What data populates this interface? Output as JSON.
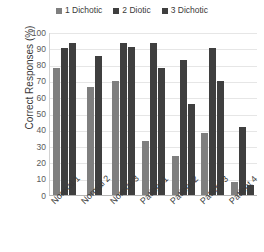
{
  "chart_data": {
    "type": "bar",
    "title": "",
    "subtitle": "",
    "xlabel": "",
    "ylabel": "Correct Responses (%)",
    "ylim": [
      0,
      100
    ],
    "ytick_step": 10,
    "yticks": [
      "100",
      "90",
      "80",
      "70",
      "60",
      "50",
      "40",
      "30",
      "20",
      "10",
      "0"
    ],
    "grid": true,
    "grid_axis": "y",
    "legend_position": "top-center",
    "categories": [
      "Normal 1",
      "Normal 2",
      "Normal 3",
      "Patient 1",
      "Patient 2",
      "Patient 3",
      "Patient 4"
    ],
    "series": [
      {
        "name": "1 Dichotic",
        "color": "#7f7f7f",
        "values": [
          78,
          66,
          70,
          33,
          24,
          38,
          8
        ]
      },
      {
        "name": "2 Diotic",
        "color": "#3f3f3f",
        "values": [
          90,
          85,
          93,
          93,
          83,
          90,
          42
        ]
      },
      {
        "name": "3 Dichotic",
        "color": "#3f3f3f",
        "values": [
          93,
          0,
          91,
          78,
          56,
          70,
          6
        ]
      }
    ]
  },
  "axis": {
    "y_title": "Correct Responses (%)"
  },
  "colors": {
    "series_1": "#7f7f7f",
    "series_2": "#3f3f3f",
    "series_3": "#3f3f3f",
    "gridline": "#e6e6e6",
    "axis_line": "#b5b5b5",
    "text": "#3a3a3a",
    "background": "#ffffff"
  }
}
